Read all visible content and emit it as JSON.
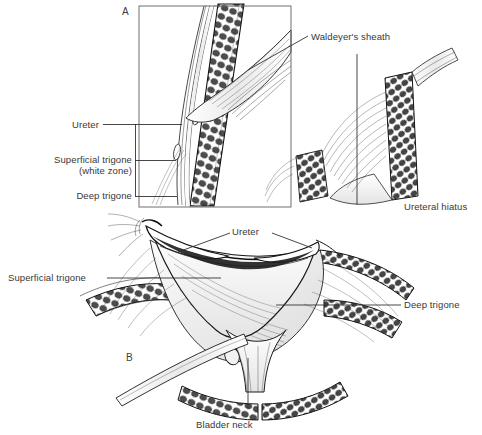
{
  "figure": {
    "kind": "anatomical-line-illustration",
    "background_color": "#ffffff",
    "ink_color": "#1a1a1a",
    "text_color": "#383838",
    "muscle_dark_color": "#4a4a4a",
    "shade_color": "#8d8d8d",
    "width": 482,
    "height": 435
  },
  "panels": [
    {
      "id": "A",
      "label": "A",
      "x": 122,
      "y": 6,
      "box": {
        "x": 139,
        "y": 6,
        "width": 152,
        "height": 201,
        "stroke": "#6f6f6f"
      }
    },
    {
      "id": "B",
      "label": "B",
      "x": 126,
      "y": 352,
      "box": null
    }
  ],
  "labels": [
    {
      "id": "ureter-a",
      "text": "Ureter",
      "x": 99,
      "y": 119,
      "align": "right"
    },
    {
      "id": "superficial-trigone-a",
      "text": "Superficial trigone",
      "x": 40,
      "y": 154,
      "align": "right"
    },
    {
      "id": "white-zone-a",
      "text": "(white zone)",
      "x": 73,
      "y": 165,
      "align": "right"
    },
    {
      "id": "deep-trigone-a",
      "text": "Deep trigone",
      "x": 67,
      "y": 190,
      "align": "right"
    },
    {
      "id": "waldeyers-sheath",
      "text": "Waldeyer's sheath",
      "x": 311,
      "y": 31,
      "align": "left"
    },
    {
      "id": "ureteral-hiatus",
      "text": "Ureteral hiatus",
      "x": 404,
      "y": 201,
      "align": "left"
    },
    {
      "id": "ureter-b",
      "text": "Ureter",
      "x": 232,
      "y": 226,
      "align": "left"
    },
    {
      "id": "superficial-trigone-b",
      "text": "Superficial trigone",
      "x": 8,
      "y": 272,
      "align": "left"
    },
    {
      "id": "deep-trigone-b",
      "text": "Deep trigone",
      "x": 404,
      "y": 299,
      "align": "left"
    },
    {
      "id": "bladder-neck",
      "text": "Bladder neck",
      "x": 196,
      "y": 419,
      "align": "left"
    }
  ],
  "leader_lines": [
    {
      "id": "bracket-a",
      "for": "panel-A-stack",
      "points": "135,124 135,196"
    },
    {
      "id": "leader-ureter-a",
      "for": "ureter-a",
      "points": "103,124 182,124"
    },
    {
      "id": "leader-sup-a",
      "for": "superficial-trigone-a",
      "points": "135,160 176,160"
    },
    {
      "id": "leader-deep-a",
      "for": "deep-trigone-a",
      "points": "135,196 177,196"
    },
    {
      "id": "leader-waldeyer",
      "for": "waldeyers-sheath",
      "points": "308,36 248,70"
    },
    {
      "id": "leader-hiatus",
      "for": "ureteral-hiatus",
      "points": "357,54 357,205"
    },
    {
      "id": "leader-ureter-b-l",
      "for": "ureter-b",
      "points": "230,233 178,252"
    },
    {
      "id": "leader-ureter-b-r",
      "for": "ureter-b",
      "points": "272,233 312,248"
    },
    {
      "id": "leader-sup-b",
      "for": "superficial-trigone-b",
      "points": "107,278 221,278"
    },
    {
      "id": "leader-deep-b",
      "for": "deep-trigone-b",
      "points": "401,305 276,305"
    },
    {
      "id": "leader-bneck",
      "for": "bladder-neck",
      "points": "248,409 248,358"
    }
  ],
  "structures": [
    {
      "id": "ureter-intramural",
      "name": "Intramural ureter",
      "panel": "A"
    },
    {
      "id": "bladder-wall-a",
      "name": "Detrusor muscle wall",
      "panel": "A"
    },
    {
      "id": "waldeyer-sheath-art",
      "name": "Waldeyer's sheath fibers",
      "panel": "A"
    },
    {
      "id": "hiatus",
      "name": "Ureteral hiatus",
      "panel": "A"
    },
    {
      "id": "trigone-superficial",
      "name": "Superficial trigone",
      "panel": "B"
    },
    {
      "id": "trigone-deep",
      "name": "Deep trigone",
      "panel": "B"
    },
    {
      "id": "bladder-neck-art",
      "name": "Bladder neck",
      "panel": "B"
    },
    {
      "id": "bladder-wall-b",
      "name": "Detrusor muscle wall",
      "panel": "B"
    }
  ]
}
